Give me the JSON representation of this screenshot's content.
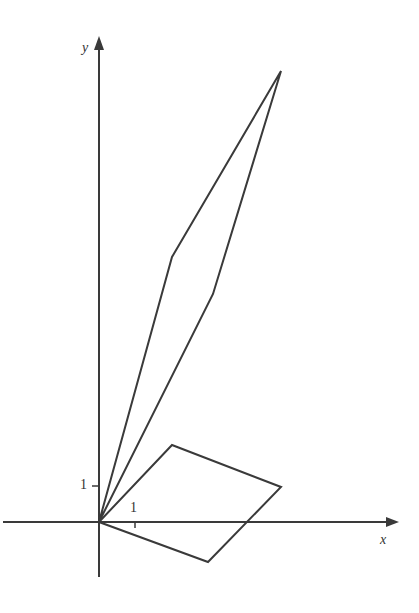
{
  "diagram": {
    "axes": {
      "x_label": "x",
      "y_label": "y",
      "x_tick_label": "1",
      "y_tick_label": "1",
      "origin_px": [
        99,
        522
      ],
      "unit_px": 36
    },
    "shapes": [
      {
        "name": "original-parallelogram",
        "vertices": [
          [
            0,
            0
          ],
          [
            2,
            2.1
          ],
          [
            5,
            1
          ],
          [
            3,
            -1.1
          ]
        ]
      },
      {
        "name": "transformed-parallelogram",
        "vertices": [
          [
            0,
            0
          ],
          [
            2,
            7.4
          ],
          [
            5,
            12.5
          ],
          [
            3.2,
            6.3
          ]
        ]
      }
    ],
    "stroke_color": "#3a3a3a"
  }
}
